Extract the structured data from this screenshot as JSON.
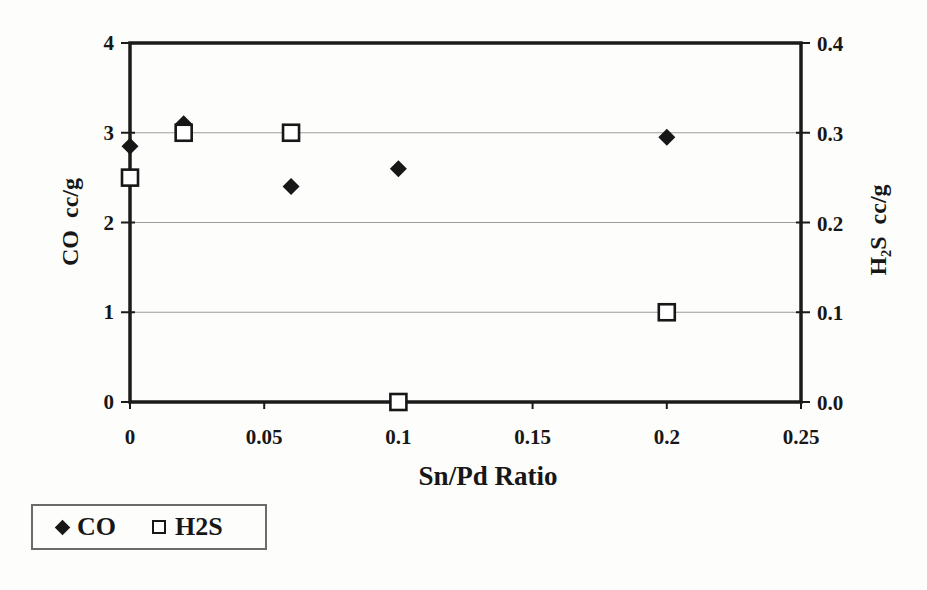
{
  "colors": {
    "background": "#fdfdfb",
    "marker": "#171717",
    "grid": "#9c9c9c",
    "border": "#1b1b1b",
    "text": "#171717",
    "legend_border": "#6b6b6b"
  },
  "chart_data": {
    "type": "scatter",
    "title": "",
    "xlabel": "Sn/Pd Ratio",
    "x": [
      0,
      0.02,
      0.06,
      0.1,
      0.2
    ],
    "series": [
      {
        "name": "CO",
        "axis": "left",
        "marker": "diamond",
        "values": [
          2.85,
          3.1,
          2.4,
          2.6,
          2.95
        ]
      },
      {
        "name": "H2S",
        "axis": "right",
        "marker": "square",
        "values": [
          0.25,
          0.3,
          0.3,
          0.0,
          0.1
        ]
      }
    ],
    "xlim": [
      0,
      0.25
    ],
    "x_tick_values": [
      0,
      0.05,
      0.1,
      0.15,
      0.2,
      0.25
    ],
    "x_tick_labels": [
      "0",
      "0.05",
      "0.1",
      "0.15",
      "0.2",
      "0.25"
    ],
    "left_axis": {
      "title": "CO  cc/g",
      "lim": [
        0,
        4
      ],
      "tick_values": [
        0,
        1,
        2,
        3,
        4
      ],
      "tick_labels": [
        "0",
        "1",
        "2",
        "3",
        "4"
      ]
    },
    "right_axis": {
      "title": "H₂S  cc/g",
      "lim": [
        0,
        0.4
      ],
      "tick_values": [
        0,
        0.1,
        0.2,
        0.3,
        0.4
      ],
      "tick_labels": [
        "0.0",
        "0.1",
        "0.2",
        "0.3",
        "0.4"
      ]
    },
    "grid": true,
    "legend_position": "bottom-left",
    "legend_items": [
      {
        "label": "CO",
        "marker": "diamond"
      },
      {
        "label": "H2S",
        "marker": "square"
      }
    ]
  }
}
